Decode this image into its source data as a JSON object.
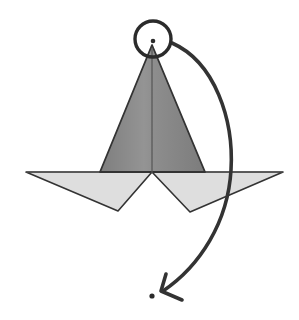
{
  "canvas": {
    "width": 299,
    "height": 320,
    "background": "#ffffff"
  },
  "figure": {
    "stroke_color": "#333333",
    "stroke_width": 1.6
  },
  "shapes": {
    "cone": {
      "name": "cone-triangle",
      "fill": "#8c8c8c",
      "stroke": "#333333",
      "stroke_width": 1.8,
      "apex": {
        "x": 152,
        "y": 45
      },
      "base_left": {
        "x": 100,
        "y": 172
      },
      "base_right": {
        "x": 205,
        "y": 172
      },
      "points": "152,45 100,172 205,172"
    },
    "cone_axis": {
      "name": "cone-center-axis-line",
      "stroke": "#555555",
      "stroke_width": 1.2,
      "x1": 152,
      "y1": 48,
      "x2": 152,
      "y2": 173
    },
    "base_left_wing": {
      "name": "base-left-wing",
      "fill": "#dedede",
      "stroke": "#333333",
      "stroke_width": 1.6,
      "points": "26,172 152,172 118,211"
    },
    "base_right_wing": {
      "name": "base-right-wing",
      "fill": "#dedede",
      "stroke": "#333333",
      "stroke_width": 1.6,
      "points": "152,172 283,172 190,212"
    },
    "base_line": {
      "name": "base-horizontal-line",
      "stroke": "#555555",
      "stroke_width": 1.2,
      "x1": 26,
      "y1": 172,
      "x2": 283,
      "y2": 172
    },
    "apex_circle": {
      "name": "apex-highlight-circle",
      "fill": "none",
      "stroke": "#2b2b2b",
      "stroke_width": 3.4,
      "cx": 153,
      "cy": 39,
      "r": 18
    },
    "apex_dot": {
      "name": "apex-vertex-dot",
      "fill": "#2b2b2b",
      "cx": 153,
      "cy": 41,
      "r": 2.3
    },
    "target_dot": {
      "name": "target-point-dot",
      "fill": "#2b2b2b",
      "cx": 152,
      "cy": 296,
      "r": 2.6
    },
    "curved_arrow": {
      "name": "curved-motion-arrow",
      "stroke": "#333333",
      "stroke_width": 3.6,
      "fill": "none",
      "path": "M 172 43 C 215 62, 234 120, 231 170 C 228 222, 200 266, 163 291",
      "start": {
        "x": 172,
        "y": 43
      },
      "end": {
        "x": 163,
        "y": 291
      }
    },
    "arrow_head": {
      "name": "arrow-head",
      "stroke": "#333333",
      "stroke_width": 3.6,
      "fill": "none",
      "tip": {
        "x": 161,
        "y": 291
      },
      "barb_upper": {
        "x": 166,
        "y": 274
      },
      "barb_lower": {
        "x": 182,
        "y": 300
      },
      "path": "M 166 274 L 161 291 L 182 300"
    }
  }
}
